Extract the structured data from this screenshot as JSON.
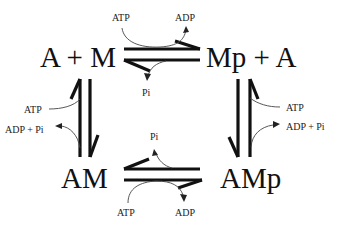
{
  "diagram": {
    "type": "reaction-cycle",
    "species": {
      "top_left": "A + M",
      "top_right": "Mp + A",
      "bottom_left": "AM",
      "bottom_right": "AMp"
    },
    "cofactors": {
      "top_in": "ATP",
      "top_out": "ADP",
      "top_release": "Pi",
      "left_in": "ATP",
      "left_out": "ADP + Pi",
      "right_in": "ATP",
      "right_out": "ADP + Pi",
      "bottom_release": "Pi",
      "bottom_in": "ATP",
      "bottom_out": "ADP"
    },
    "colors": {
      "ink": "#111111",
      "background": "#ffffff"
    }
  }
}
